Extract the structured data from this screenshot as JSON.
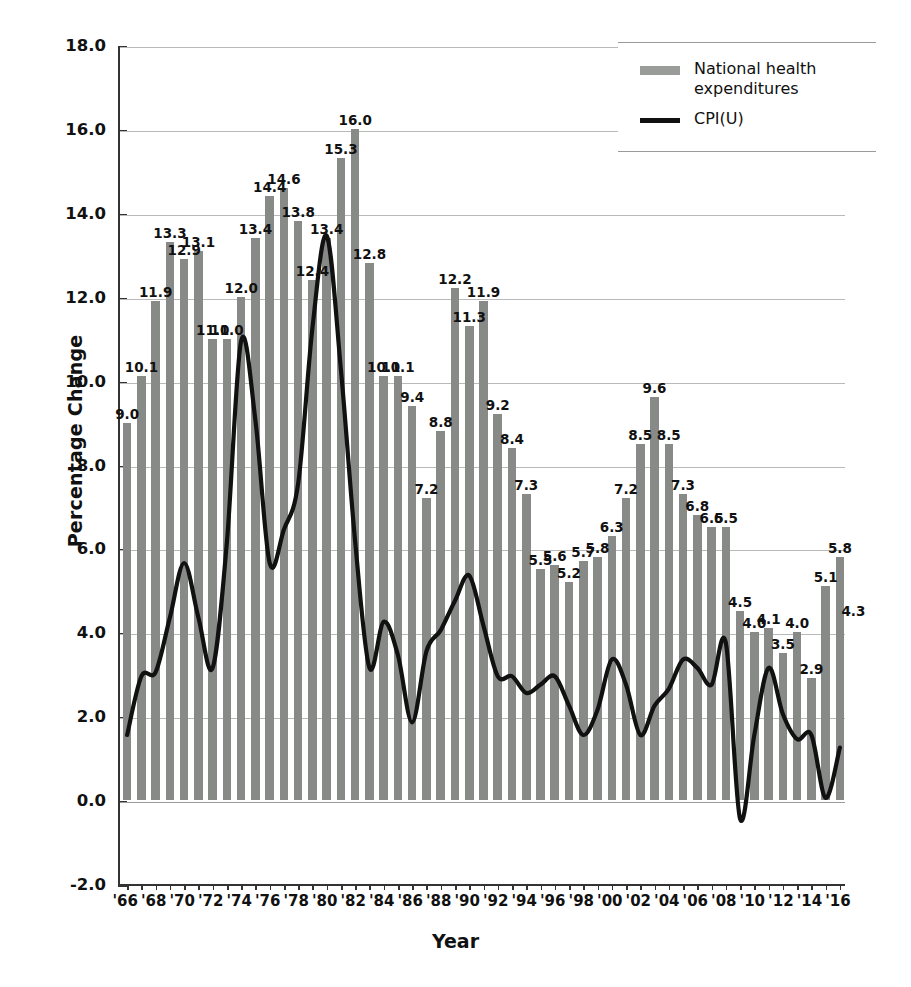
{
  "chart_data": {
    "type": "bar",
    "title": "",
    "xlabel": "Year",
    "ylabel": "Percentage Change",
    "ylim": [
      -2.0,
      18.0
    ],
    "ytick_step": 2.0,
    "ytick_labels": [
      "18.0",
      "16.0",
      "14.0",
      "12.0",
      "10.0",
      "8.0",
      "6.0",
      "4.0",
      "2.0",
      "0.0",
      "-2.0"
    ],
    "ytick_values": [
      18.0,
      16.0,
      14.0,
      12.0,
      10.0,
      8.0,
      6.0,
      4.0,
      2.0,
      0.0,
      -2.0
    ],
    "grid": true,
    "legend_position": "top-right",
    "categories": [
      "1966",
      "1967",
      "1968",
      "1969",
      "1970",
      "1971",
      "1972",
      "1973",
      "1974",
      "1975",
      "1976",
      "1977",
      "1978",
      "1979",
      "1980",
      "1981",
      "1982",
      "1983",
      "1984",
      "1985",
      "1986",
      "1987",
      "1988",
      "1989",
      "1990",
      "1991",
      "1992",
      "1993",
      "1994",
      "1995",
      "1996",
      "1997",
      "1998",
      "1999",
      "2000",
      "2001",
      "2002",
      "2003",
      "2004",
      "2005",
      "2006",
      "2007",
      "2008",
      "2009",
      "2010",
      "2011",
      "2012",
      "2013",
      "2014",
      "2015",
      "2016"
    ],
    "xtick_labels": [
      "'66",
      "'68",
      "'70",
      "'72",
      "'74",
      "'76",
      "'78",
      "'80",
      "'82",
      "'84",
      "'86",
      "'88",
      "'90",
      "'92",
      "'94",
      "'96",
      "'98",
      "'00",
      "'02",
      "'04",
      "'06",
      "'08",
      "'10",
      "'12",
      "'14",
      "'16"
    ],
    "xtick_years": [
      1966,
      1968,
      1970,
      1972,
      1974,
      1976,
      1978,
      1980,
      1982,
      1984,
      1986,
      1988,
      1990,
      1992,
      1994,
      1996,
      1998,
      2000,
      2002,
      2004,
      2006,
      2008,
      2010,
      2012,
      2014,
      2016
    ],
    "series": [
      {
        "name": "National health expenditures",
        "kind": "bar",
        "color": "#888a88",
        "labels_shown": true,
        "values": [
          9.0,
          10.1,
          11.9,
          13.3,
          12.9,
          13.1,
          11.0,
          11.0,
          12.0,
          13.4,
          14.4,
          14.6,
          13.8,
          12.4,
          13.4,
          15.3,
          16.0,
          12.8,
          10.1,
          10.1,
          9.4,
          7.2,
          8.8,
          12.2,
          11.3,
          11.9,
          9.2,
          8.4,
          7.3,
          5.5,
          5.6,
          5.2,
          5.7,
          5.8,
          6.3,
          7.2,
          8.5,
          9.6,
          8.5,
          7.3,
          6.8,
          6.5,
          6.5,
          4.5,
          4.0,
          4.1,
          3.5,
          4.0,
          2.9,
          5.1,
          5.8
        ],
        "value_labels": [
          "9.0",
          "10.1",
          "11.9",
          "13.3",
          "12.9",
          "13.1",
          "11.0",
          "11.0",
          "12.0",
          "13.4",
          "14.4",
          "14.6",
          "13.8",
          "12.4",
          "13.4",
          "15.3",
          "16.0",
          "12.8",
          "10.1",
          "10.1",
          "9.4",
          "7.2",
          "8.8",
          "12.2",
          "11.3",
          "11.9",
          "9.2",
          "8.4",
          "7.3",
          "5.5",
          "5.6",
          "5.2",
          "5.7",
          "5.8",
          "6.3",
          "7.2",
          "8.5",
          "9.6",
          "8.5",
          "7.3",
          "6.8",
          "6.5",
          "6.5",
          "4.5",
          "4.0",
          "4.1",
          "3.5",
          "4.0",
          "2.9",
          "5.1",
          "5.8"
        ]
      },
      {
        "name": "CPI(U)",
        "kind": "line",
        "color": "#111111",
        "labels_shown": false,
        "values": [
          1.6,
          3.0,
          3.1,
          4.4,
          5.7,
          4.4,
          3.2,
          6.2,
          11.0,
          9.1,
          5.7,
          6.5,
          7.6,
          11.3,
          13.5,
          10.3,
          6.2,
          3.2,
          4.3,
          3.5,
          1.9,
          3.6,
          4.1,
          4.8,
          5.4,
          4.2,
          3.0,
          3.0,
          2.6,
          2.8,
          3.0,
          2.3,
          1.6,
          2.2,
          3.4,
          2.8,
          1.6,
          2.3,
          2.7,
          3.4,
          3.2,
          2.8,
          3.8,
          -0.4,
          1.6,
          3.2,
          2.1,
          1.5,
          1.6,
          0.1,
          1.3
        ]
      }
    ],
    "extra_bar_label": {
      "year": 2016,
      "label": "4.3",
      "value": 4.3
    }
  },
  "legend": {
    "entries": [
      {
        "label_line1": "National health",
        "label_line2": "expenditures",
        "swatch": "bar-swatch"
      },
      {
        "label_line1": "CPI(U)",
        "label_line2": "",
        "swatch": "line-swatch"
      }
    ]
  },
  "axis": {
    "y_title": "Percentage Change",
    "x_title": "Year"
  }
}
